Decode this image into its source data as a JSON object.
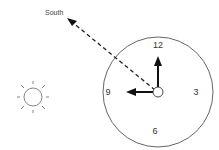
{
  "diagram": {
    "direction_label": "South",
    "clock_numbers": {
      "twelve": "12",
      "three": "3",
      "six": "6",
      "nine": "9"
    },
    "elements": [
      "sun",
      "clock-face",
      "hour-hand-pointing-9",
      "minute-hand-pointing-12",
      "dashed-arrow-to-south"
    ],
    "colors": {
      "stroke": "#333333",
      "hands": "#111111",
      "background": "#ffffff"
    }
  }
}
